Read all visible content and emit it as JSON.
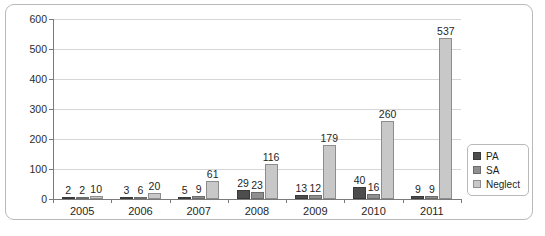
{
  "chart_data": {
    "type": "bar",
    "title": "",
    "xlabel": "",
    "ylabel": "",
    "ylim": [
      0,
      600
    ],
    "ytick_step": 100,
    "yticks": [
      600,
      500,
      400,
      300,
      200,
      100,
      0
    ],
    "grid": true,
    "legend_position": "right",
    "categories": [
      "2005",
      "2006",
      "2007",
      "2008",
      "2009",
      "2010",
      "2011"
    ],
    "series": [
      {
        "name": "PA",
        "color": "#4d4d4d",
        "values": [
          2,
          3,
          5,
          29,
          13,
          40,
          9
        ]
      },
      {
        "name": "SA",
        "color": "#8f8f8f",
        "values": [
          2,
          6,
          9,
          23,
          12,
          16,
          9
        ]
      },
      {
        "name": "Neglect",
        "color": "#c8c8c8",
        "values": [
          10,
          20,
          61,
          116,
          179,
          260,
          537
        ]
      }
    ],
    "data_labels": [
      [
        "2",
        "2",
        "10"
      ],
      [
        "3",
        "6",
        "20"
      ],
      [
        "5",
        "9",
        "61"
      ],
      [
        "29",
        "23",
        "116"
      ],
      [
        "13",
        "12",
        "179"
      ],
      [
        "40",
        "16",
        "260"
      ],
      [
        "9",
        "9",
        "537"
      ]
    ]
  },
  "legend": {
    "items": [
      {
        "label": "PA"
      },
      {
        "label": "SA"
      },
      {
        "label": "Neglect"
      }
    ]
  },
  "caption": {
    "text": ""
  }
}
